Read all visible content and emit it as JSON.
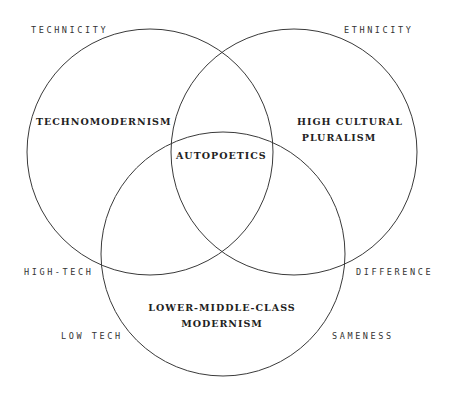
{
  "diagram": {
    "type": "venn",
    "stroke_color": "#3a3a3a",
    "text_color": "#222222",
    "background": "#ffffff",
    "circles": [
      {
        "id": "technicity",
        "cx": 150,
        "cy": 152,
        "r": 123
      },
      {
        "id": "ethnicity",
        "cx": 294,
        "cy": 152,
        "r": 123
      },
      {
        "id": "class",
        "cx": 223,
        "cy": 254,
        "r": 122
      }
    ],
    "axis_labels": {
      "technicity": "TECHNICITY",
      "ethnicity": "ETHNICITY",
      "high_tech": "HIGH-TECH",
      "low_tech": "LOW TECH",
      "difference": "DIFFERENCE",
      "sameness": "SAMENESS"
    },
    "regions": {
      "technomodernism": "TECHNOMODERNISM",
      "high_cultural_pluralism_line1": "HIGH CULTURAL",
      "high_cultural_pluralism_line2": "PLURALISM",
      "autopoetics": "AUTOPOETICS",
      "lower_middle_class_line1": "LOWER-MIDDLE-CLASS",
      "lower_middle_class_line2": "MODERNISM"
    }
  }
}
